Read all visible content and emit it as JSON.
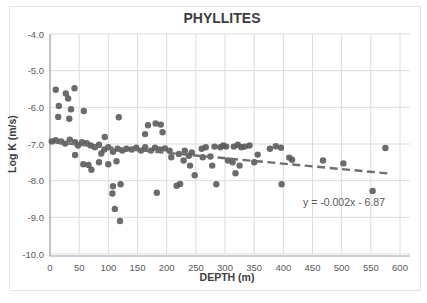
{
  "figure": {
    "background": "#ffffff",
    "frame_color": "#e4e4e4"
  },
  "chart_data": {
    "type": "scatter",
    "title": "PHYLLITES",
    "xlabel": "DEPTH (m)",
    "ylabel": "Log K (m/s)",
    "xlim": [
      0,
      600
    ],
    "ylim": [
      -10.0,
      -4.0
    ],
    "x_ticks": [
      0,
      50,
      100,
      150,
      200,
      250,
      300,
      350,
      400,
      450,
      500,
      550,
      600
    ],
    "y_ticks": [
      -4.0,
      -5.0,
      -6.0,
      -7.0,
      -8.0,
      -9.0,
      -10.0
    ],
    "grid": true,
    "legend": "none",
    "colors": {
      "point": "#565656",
      "gridline": "#dcdcdc",
      "axis_line": "#a6a6a6",
      "trendline": "#6e6e6e"
    },
    "trendline": {
      "equation_label": "y = -0.002x - 6.87",
      "style": "dashed",
      "x_start": 10,
      "y_start": -6.96,
      "x_end": 585,
      "y_end": -7.81
    },
    "points": [
      [
        10,
        -5.52
      ],
      [
        27,
        -5.62
      ],
      [
        42,
        -5.48
      ],
      [
        31,
        -5.76
      ],
      [
        15,
        -5.96
      ],
      [
        36,
        -6.05
      ],
      [
        14,
        -6.26
      ],
      [
        33,
        -6.31
      ],
      [
        58,
        -6.1
      ],
      [
        118,
        -6.27
      ],
      [
        94,
        -6.81
      ],
      [
        163,
        -6.73
      ],
      [
        168,
        -6.49
      ],
      [
        190,
        -6.47
      ],
      [
        181,
        -6.44
      ],
      [
        193,
        -6.68
      ],
      [
        3,
        -6.93
      ],
      [
        10,
        -6.9
      ],
      [
        19,
        -6.93
      ],
      [
        26,
        -6.99
      ],
      [
        34,
        -6.88
      ],
      [
        43,
        -6.95
      ],
      [
        48,
        -7.04
      ],
      [
        55,
        -6.95
      ],
      [
        63,
        -6.98
      ],
      [
        70,
        -7.04
      ],
      [
        77,
        -7.09
      ],
      [
        84,
        -7.02
      ],
      [
        93,
        -7.15
      ],
      [
        100,
        -7.09
      ],
      [
        108,
        -7.21
      ],
      [
        116,
        -7.13
      ],
      [
        124,
        -7.18
      ],
      [
        131,
        -7.13
      ],
      [
        140,
        -7.15
      ],
      [
        148,
        -7.1
      ],
      [
        156,
        -7.18
      ],
      [
        163,
        -7.09
      ],
      [
        173,
        -7.18
      ],
      [
        180,
        -7.1
      ],
      [
        188,
        -7.15
      ],
      [
        197,
        -7.12
      ],
      [
        205,
        -7.18
      ],
      [
        43,
        -7.3
      ],
      [
        57,
        -7.55
      ],
      [
        66,
        -7.57
      ],
      [
        71,
        -7.7
      ],
      [
        84,
        -7.5
      ],
      [
        88,
        -7.26
      ],
      [
        100,
        -7.55
      ],
      [
        114,
        -7.47
      ],
      [
        108,
        -8.15
      ],
      [
        121,
        -8.1
      ],
      [
        107,
        -8.35
      ],
      [
        111,
        -8.77
      ],
      [
        120,
        -9.1
      ],
      [
        183,
        -8.33
      ],
      [
        217,
        -8.14
      ],
      [
        223,
        -8.09
      ],
      [
        285,
        -8.1
      ],
      [
        397,
        -8.1
      ],
      [
        553,
        -8.28
      ],
      [
        208,
        -7.36
      ],
      [
        221,
        -7.27
      ],
      [
        231,
        -7.18
      ],
      [
        229,
        -7.45
      ],
      [
        238,
        -7.32
      ],
      [
        243,
        -7.23
      ],
      [
        240,
        -7.59
      ],
      [
        248,
        -7.85
      ],
      [
        260,
        -7.13
      ],
      [
        267,
        -7.09
      ],
      [
        262,
        -7.36
      ],
      [
        275,
        -7.34
      ],
      [
        282,
        -7.07
      ],
      [
        278,
        -7.59
      ],
      [
        292,
        -7.09
      ],
      [
        297,
        -7.04
      ],
      [
        302,
        -7.07
      ],
      [
        305,
        -7.45
      ],
      [
        313,
        -7.5
      ],
      [
        315,
        -7.07
      ],
      [
        322,
        -7.02
      ],
      [
        328,
        -7.09
      ],
      [
        334,
        -7.07
      ],
      [
        325,
        -7.59
      ],
      [
        318,
        -7.8
      ],
      [
        342,
        -7.04
      ],
      [
        350,
        -7.5
      ],
      [
        356,
        -7.29
      ],
      [
        377,
        -7.13
      ],
      [
        387,
        -7.06
      ],
      [
        396,
        -7.1
      ],
      [
        410,
        -7.37
      ],
      [
        415,
        -7.43
      ],
      [
        468,
        -7.45
      ],
      [
        503,
        -7.53
      ],
      [
        575,
        -7.11
      ]
    ]
  }
}
